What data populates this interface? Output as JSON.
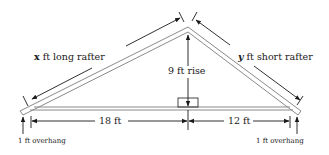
{
  "diagram": {
    "type": "roof truss geometry",
    "labels": {
      "long_rafter_var": "x",
      "long_rafter_text": " ft long rafter",
      "short_rafter_var": "y",
      "short_rafter_text": " ft short rafter",
      "rise": "9 ft rise",
      "left_run": "18 ft",
      "right_run": "12 ft",
      "left_overhang": "1 ft overhang",
      "right_overhang": "1 ft overhang"
    },
    "measurements": {
      "rise_ft": 9,
      "left_run_ft": 18,
      "right_run_ft": 12,
      "overhang_ft": 1
    },
    "colors": {
      "rafter_outline": "#8a8a8a",
      "line": "#1a1a1a",
      "background": "#ffffff"
    }
  }
}
